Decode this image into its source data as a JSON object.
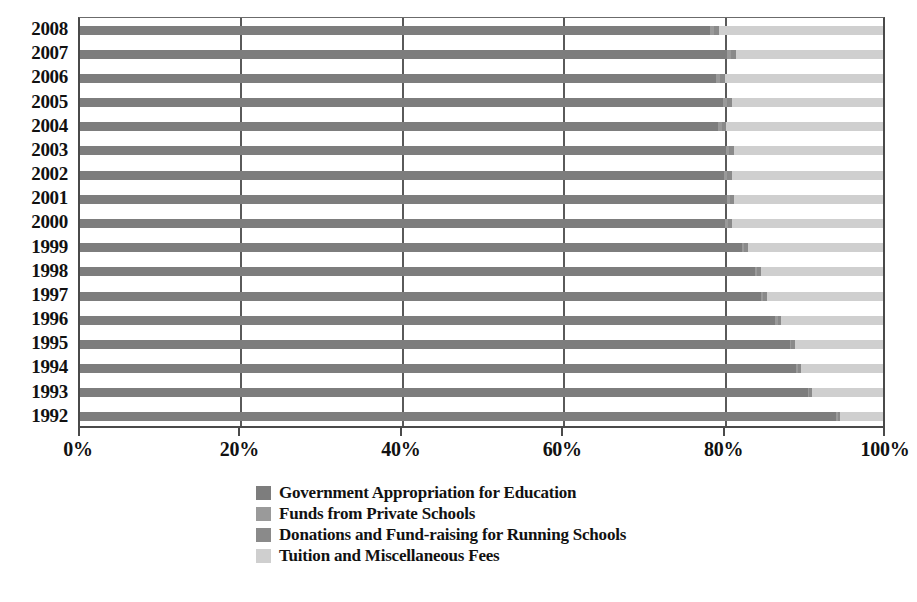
{
  "chart_data": {
    "type": "bar",
    "orientation": "horizontal",
    "stacked": true,
    "normalized": true,
    "title": "",
    "xlabel": "",
    "ylabel": "",
    "xlim": [
      0,
      100
    ],
    "grid": true,
    "legend_position": "bottom",
    "x_ticks": [
      "0%",
      "20%",
      "40%",
      "60%",
      "80%",
      "100%"
    ],
    "x_tick_values": [
      0,
      20,
      40,
      60,
      80,
      100
    ],
    "categories": [
      "2008",
      "2007",
      "2006",
      "2005",
      "2004",
      "2003",
      "2002",
      "2001",
      "2000",
      "1999",
      "1998",
      "1997",
      "1996",
      "1995",
      "1994",
      "1993",
      "1992"
    ],
    "series": [
      {
        "name": "Government Appropriation for Education",
        "color": "#7d7d7d",
        "values": [
          78.5,
          80.6,
          79.2,
          80.1,
          79.4,
          80.4,
          80.2,
          80.6,
          80.3,
          82.4,
          84.0,
          84.8,
          86.6,
          88.4,
          89.2,
          90.6,
          94.2
        ]
      },
      {
        "name": "Funds from Private Schools",
        "color": "#9a9a9a",
        "values": [
          0.5,
          0.5,
          0.5,
          0.5,
          0.5,
          0.4,
          0.4,
          0.4,
          0.4,
          0.3,
          0.3,
          0.3,
          0.3,
          0.2,
          0.2,
          0.2,
          0.2
        ]
      },
      {
        "name": "Donations and Fund-raising for Running Schools",
        "color": "#8a8a8a",
        "values": [
          0.6,
          0.6,
          0.6,
          0.6,
          0.6,
          0.6,
          0.6,
          0.5,
          0.5,
          0.5,
          0.5,
          0.5,
          0.4,
          0.4,
          0.4,
          0.4,
          0.3
        ]
      },
      {
        "name": "Tuition and Miscellaneous Fees",
        "color": "#cfcfcf",
        "values": [
          20.4,
          18.3,
          19.7,
          18.8,
          19.5,
          18.6,
          18.8,
          18.5,
          18.8,
          16.8,
          15.2,
          14.4,
          12.7,
          11.0,
          10.2,
          8.8,
          5.3
        ]
      }
    ]
  },
  "axis": {
    "y_labels": [
      "2008",
      "2007",
      "2006",
      "2005",
      "2004",
      "2003",
      "2002",
      "2001",
      "2000",
      "1999",
      "1998",
      "1997",
      "1996",
      "1995",
      "1994",
      "1993",
      "1992"
    ],
    "x_labels": [
      "0%",
      "20%",
      "40%",
      "60%",
      "80%",
      "100%"
    ]
  },
  "legend": {
    "items": [
      {
        "label": "Government Appropriation for Education",
        "color": "#7d7d7d"
      },
      {
        "label": "Funds from Private Schools",
        "color": "#9a9a9a"
      },
      {
        "label": "Donations and Fund-raising for Running Schools",
        "color": "#8a8a8a"
      },
      {
        "label": "Tuition and Miscellaneous Fees",
        "color": "#cfcfcf"
      }
    ]
  }
}
